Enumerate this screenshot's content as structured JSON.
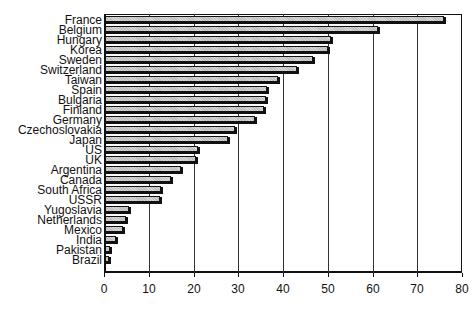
{
  "chart_data": {
    "type": "bar",
    "orientation": "horizontal",
    "title": "",
    "xlabel": "",
    "ylabel": "",
    "xlim": [
      0,
      80
    ],
    "x_ticks": [
      0,
      10,
      20,
      30,
      40,
      50,
      60,
      70,
      80
    ],
    "grid": "vertical lines at major ticks",
    "legend": null,
    "categories": [
      "France",
      "Belgium",
      "Hungary",
      "Korea",
      "Sweden",
      "Switzerland",
      "Taiwan",
      "Spain",
      "Bulgaria",
      "Finland",
      "Germany",
      "Czechoslovakia",
      "Japan",
      "US",
      "UK",
      "Argentina",
      "Canada",
      "South Africa",
      "USSR",
      "Yugoslavia",
      "Netherlands",
      "Mexico",
      "India",
      "Pakistan",
      "Brazil"
    ],
    "values": [
      75.8,
      61,
      50.5,
      49.8,
      46.5,
      43,
      38.7,
      36.2,
      36,
      35.5,
      33.6,
      29,
      27.5,
      20.8,
      20.4,
      17,
      14.8,
      12.5,
      12.2,
      5.4,
      4.7,
      4,
      2.5,
      1.1,
      0.9
    ]
  },
  "colors": {
    "bar_fill": "#d8d8d8",
    "bar_shadow": "#111111",
    "axis": "#111111",
    "background": "#ffffff"
  }
}
